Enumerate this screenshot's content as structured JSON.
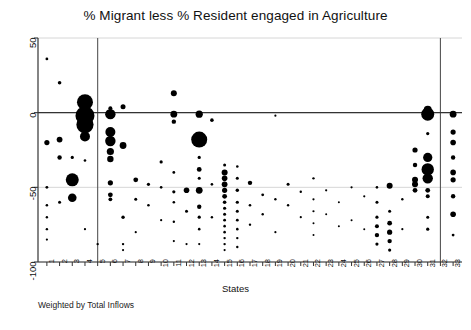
{
  "chart_data": {
    "type": "scatter",
    "title": "% Migrant less % Resident engaged in Agriculture",
    "xlabel": "States",
    "ylabel": "",
    "footnote": "Weighted by Total Inflows",
    "subtitle": "",
    "grid": true,
    "legend_position": "none",
    "xlim": [
      0.3,
      33.7
    ],
    "ylim": [
      -100,
      50
    ],
    "yticks": [
      50,
      0,
      -50,
      -100
    ],
    "ytick_labels": [
      "50",
      "0",
      "-50",
      "-100"
    ],
    "xticks": [
      1,
      2,
      3,
      4,
      5,
      6,
      7,
      8,
      9,
      10,
      11,
      12,
      13,
      14,
      15,
      16,
      17,
      18,
      19,
      20,
      21,
      22,
      23,
      24,
      25,
      26,
      27,
      28,
      29,
      30,
      31,
      32,
      33
    ],
    "xtick_labels": [
      "1",
      "2",
      "3",
      "4",
      "5",
      "6",
      "7",
      "8",
      "9",
      "10",
      "11",
      "12",
      "13",
      "14",
      "15",
      "16",
      "17",
      "18",
      "19",
      "20",
      "21",
      "22",
      "23",
      "24",
      "25",
      "26",
      "27",
      "28",
      "29",
      "30",
      "31",
      "32",
      "33"
    ],
    "reference_lines": {
      "horizontal": [
        0
      ],
      "vertical": [
        5,
        32
      ]
    },
    "marker_color": "#000000",
    "size_note": "Bubble area weighted by Total Inflows",
    "points": [
      {
        "x": 1,
        "y": -20,
        "s": 2.6
      },
      {
        "x": 1,
        "y": -50,
        "s": 1.4
      },
      {
        "x": 1,
        "y": -62,
        "s": 1.3
      },
      {
        "x": 1,
        "y": -70,
        "s": 1.2
      },
      {
        "x": 1,
        "y": -78,
        "s": 1.2
      },
      {
        "x": 1,
        "y": -85,
        "s": 1.1
      },
      {
        "x": 1,
        "y": 36,
        "s": 1.4
      },
      {
        "x": 2,
        "y": -18,
        "s": 2.9
      },
      {
        "x": 2,
        "y": -30,
        "s": 2.2
      },
      {
        "x": 2,
        "y": 20,
        "s": 1.8
      },
      {
        "x": 2,
        "y": -60,
        "s": 1.5
      },
      {
        "x": 3,
        "y": -45,
        "s": 6.5
      },
      {
        "x": 3,
        "y": -57,
        "s": 4.3
      },
      {
        "x": 3,
        "y": -30,
        "s": 1.6
      },
      {
        "x": 4,
        "y": 7,
        "s": 8.0
      },
      {
        "x": 4,
        "y": -2,
        "s": 9.5
      },
      {
        "x": 4,
        "y": -8,
        "s": 8.6
      },
      {
        "x": 4,
        "y": -16,
        "s": 5.0
      },
      {
        "x": 4,
        "y": -32,
        "s": 1.3
      },
      {
        "x": 4,
        "y": -78,
        "s": 1.1
      },
      {
        "x": 5,
        "y": -88,
        "s": 1.2
      },
      {
        "x": 6,
        "y": -1,
        "s": 5.2
      },
      {
        "x": 6,
        "y": -13,
        "s": 5.0
      },
      {
        "x": 6,
        "y": -19,
        "s": 5.2
      },
      {
        "x": 6,
        "y": -26,
        "s": 3.6
      },
      {
        "x": 6,
        "y": -31,
        "s": 3.2
      },
      {
        "x": 6,
        "y": -47,
        "s": 2.6
      },
      {
        "x": 6,
        "y": -55,
        "s": 2.4
      },
      {
        "x": 6,
        "y": -58,
        "s": 1.9
      },
      {
        "x": 6,
        "y": 3,
        "s": 2.0
      },
      {
        "x": 7,
        "y": 4,
        "s": 2.5
      },
      {
        "x": 7,
        "y": -22,
        "s": 3.4
      },
      {
        "x": 7,
        "y": -70,
        "s": 1.7
      },
      {
        "x": 7,
        "y": -88,
        "s": 1.2
      },
      {
        "x": 7,
        "y": -92,
        "s": 1.1
      },
      {
        "x": 8,
        "y": -45,
        "s": 2.4
      },
      {
        "x": 8,
        "y": -58,
        "s": 1.5
      },
      {
        "x": 8,
        "y": -80,
        "s": 1.1
      },
      {
        "x": 9,
        "y": -48,
        "s": 1.6
      },
      {
        "x": 9,
        "y": -62,
        "s": 1.3
      },
      {
        "x": 10,
        "y": -33,
        "s": 1.6
      },
      {
        "x": 10,
        "y": -50,
        "s": 1.3
      },
      {
        "x": 10,
        "y": -72,
        "s": 1.1
      },
      {
        "x": 11,
        "y": 13,
        "s": 3.0
      },
      {
        "x": 11,
        "y": -1,
        "s": 3.4
      },
      {
        "x": 11,
        "y": -6,
        "s": 2.2
      },
      {
        "x": 11,
        "y": -40,
        "s": 1.4
      },
      {
        "x": 11,
        "y": -53,
        "s": 1.6
      },
      {
        "x": 11,
        "y": -60,
        "s": 1.3
      },
      {
        "x": 11,
        "y": -73,
        "s": 1.2
      },
      {
        "x": 11,
        "y": -86,
        "s": 1.1
      },
      {
        "x": 12,
        "y": -52,
        "s": 2.8
      },
      {
        "x": 12,
        "y": -66,
        "s": 1.5
      },
      {
        "x": 12,
        "y": -88,
        "s": 1.1
      },
      {
        "x": 13,
        "y": -1,
        "s": 3.6
      },
      {
        "x": 13,
        "y": -18,
        "s": 8.0
      },
      {
        "x": 13,
        "y": -30,
        "s": 1.6
      },
      {
        "x": 13,
        "y": -38,
        "s": 2.4
      },
      {
        "x": 13,
        "y": -44,
        "s": 1.5
      },
      {
        "x": 13,
        "y": -52,
        "s": 3.4
      },
      {
        "x": 13,
        "y": -63,
        "s": 2.2
      },
      {
        "x": 13,
        "y": -70,
        "s": 1.6
      },
      {
        "x": 13,
        "y": -78,
        "s": 1.3
      },
      {
        "x": 13,
        "y": -88,
        "s": 1.1
      },
      {
        "x": 14,
        "y": -5,
        "s": 1.8
      },
      {
        "x": 14,
        "y": -48,
        "s": 1.3
      },
      {
        "x": 14,
        "y": -70,
        "s": 1.2
      },
      {
        "x": 15,
        "y": -40,
        "s": 3.0
      },
      {
        "x": 15,
        "y": -44,
        "s": 2.8
      },
      {
        "x": 15,
        "y": -48,
        "s": 2.9
      },
      {
        "x": 15,
        "y": -52,
        "s": 2.6
      },
      {
        "x": 15,
        "y": -56,
        "s": 2.4
      },
      {
        "x": 15,
        "y": -60,
        "s": 1.8
      },
      {
        "x": 15,
        "y": -64,
        "s": 1.6
      },
      {
        "x": 15,
        "y": -68,
        "s": 1.5
      },
      {
        "x": 15,
        "y": -72,
        "s": 1.4
      },
      {
        "x": 15,
        "y": -76,
        "s": 1.3
      },
      {
        "x": 15,
        "y": -80,
        "s": 1.3
      },
      {
        "x": 15,
        "y": -84,
        "s": 1.2
      },
      {
        "x": 15,
        "y": -88,
        "s": 1.2
      },
      {
        "x": 15,
        "y": -92,
        "s": 1.1
      },
      {
        "x": 15,
        "y": -35,
        "s": 1.5
      },
      {
        "x": 16,
        "y": -44,
        "s": 1.5
      },
      {
        "x": 16,
        "y": -52,
        "s": 1.7
      },
      {
        "x": 16,
        "y": -60,
        "s": 1.6
      },
      {
        "x": 16,
        "y": -66,
        "s": 1.5
      },
      {
        "x": 16,
        "y": -72,
        "s": 1.4
      },
      {
        "x": 16,
        "y": -78,
        "s": 1.3
      },
      {
        "x": 16,
        "y": -84,
        "s": 1.2
      },
      {
        "x": 16,
        "y": -90,
        "s": 1.2
      },
      {
        "x": 16,
        "y": -36,
        "s": 1.3
      },
      {
        "x": 17,
        "y": -47,
        "s": 2.2
      },
      {
        "x": 17,
        "y": -62,
        "s": 1.3
      },
      {
        "x": 17,
        "y": -75,
        "s": 1.2
      },
      {
        "x": 18,
        "y": -55,
        "s": 1.4
      },
      {
        "x": 18,
        "y": -68,
        "s": 1.2
      },
      {
        "x": 19,
        "y": -2,
        "s": 1.1
      },
      {
        "x": 19,
        "y": -58,
        "s": 1.2
      },
      {
        "x": 19,
        "y": -80,
        "s": 1.1
      },
      {
        "x": 20,
        "y": -48,
        "s": 1.5
      },
      {
        "x": 20,
        "y": -62,
        "s": 1.2
      },
      {
        "x": 21,
        "y": -53,
        "s": 1.2
      },
      {
        "x": 21,
        "y": -70,
        "s": 1.1
      },
      {
        "x": 22,
        "y": -44,
        "s": 1.2
      },
      {
        "x": 22,
        "y": -58,
        "s": 1.1
      },
      {
        "x": 22,
        "y": -66,
        "s": 1.1
      },
      {
        "x": 22,
        "y": -74,
        "s": 1.0
      },
      {
        "x": 22,
        "y": -82,
        "s": 1.0
      },
      {
        "x": 23,
        "y": -52,
        "s": 1.1
      },
      {
        "x": 23,
        "y": -68,
        "s": 1.0
      },
      {
        "x": 24,
        "y": -60,
        "s": 1.0
      },
      {
        "x": 24,
        "y": -76,
        "s": 1.0
      },
      {
        "x": 25,
        "y": -50,
        "s": 1.1
      },
      {
        "x": 25,
        "y": -72,
        "s": 1.0
      },
      {
        "x": 26,
        "y": -56,
        "s": 1.1
      },
      {
        "x": 26,
        "y": -78,
        "s": 1.0
      },
      {
        "x": 27,
        "y": -60,
        "s": 1.5
      },
      {
        "x": 27,
        "y": -70,
        "s": 1.6
      },
      {
        "x": 27,
        "y": -76,
        "s": 2.0
      },
      {
        "x": 27,
        "y": -82,
        "s": 2.2
      },
      {
        "x": 27,
        "y": -88,
        "s": 1.6
      },
      {
        "x": 27,
        "y": -50,
        "s": 1.3
      },
      {
        "x": 28,
        "y": -49,
        "s": 3.0
      },
      {
        "x": 28,
        "y": -66,
        "s": 1.5
      },
      {
        "x": 28,
        "y": -74,
        "s": 2.4
      },
      {
        "x": 28,
        "y": -80,
        "s": 2.6
      },
      {
        "x": 28,
        "y": -86,
        "s": 2.2
      },
      {
        "x": 28,
        "y": -92,
        "s": 1.6
      },
      {
        "x": 29,
        "y": -58,
        "s": 1.2
      },
      {
        "x": 29,
        "y": -78,
        "s": 1.1
      },
      {
        "x": 30,
        "y": -25,
        "s": 2.6
      },
      {
        "x": 30,
        "y": -35,
        "s": 2.2
      },
      {
        "x": 30,
        "y": -45,
        "s": 3.0
      },
      {
        "x": 30,
        "y": -52,
        "s": 2.4
      },
      {
        "x": 31,
        "y": -1,
        "s": 6.5
      },
      {
        "x": 31,
        "y": 2,
        "s": 4.0
      },
      {
        "x": 31,
        "y": -14,
        "s": 1.6
      },
      {
        "x": 31,
        "y": -30,
        "s": 4.6
      },
      {
        "x": 31,
        "y": -38,
        "s": 6.2
      },
      {
        "x": 31,
        "y": -44,
        "s": 5.2
      },
      {
        "x": 31,
        "y": -52,
        "s": 2.4
      },
      {
        "x": 31,
        "y": -56,
        "s": 2.0
      },
      {
        "x": 31,
        "y": -70,
        "s": 1.5
      },
      {
        "x": 31,
        "y": -78,
        "s": 1.6
      },
      {
        "x": 30,
        "y": -48,
        "s": 3.0
      },
      {
        "x": 33,
        "y": -1,
        "s": 3.4
      },
      {
        "x": 33,
        "y": -13,
        "s": 2.6
      },
      {
        "x": 33,
        "y": -20,
        "s": 2.8
      },
      {
        "x": 33,
        "y": -30,
        "s": 2.2
      },
      {
        "x": 33,
        "y": -40,
        "s": 2.8
      },
      {
        "x": 33,
        "y": -45,
        "s": 2.6
      },
      {
        "x": 33,
        "y": -56,
        "s": 2.2
      },
      {
        "x": 33,
        "y": -68,
        "s": 2.8
      },
      {
        "x": 33,
        "y": -82,
        "s": 1.4
      }
    ]
  }
}
